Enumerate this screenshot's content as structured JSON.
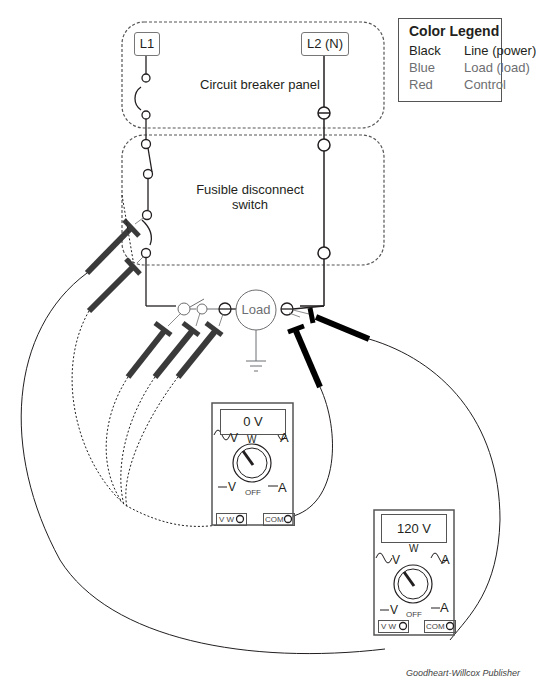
{
  "legend": {
    "title": "Color Legend",
    "rows": [
      {
        "color": "Black",
        "meaning": "Line (power)",
        "hex": "#231f20"
      },
      {
        "color": "Blue",
        "meaning": "Load (load)",
        "hex": "#6d6e71"
      },
      {
        "color": "Red",
        "meaning": "Control",
        "hex": "#6d6e71"
      }
    ]
  },
  "terminals": {
    "l1": "L1",
    "l2": "L2 (N)"
  },
  "panels": {
    "breaker": "Circuit breaker panel",
    "disconnect_line1": "Fusible disconnect",
    "disconnect_line2": "switch"
  },
  "load": {
    "label": "Load"
  },
  "meters": [
    {
      "id": "meter-1",
      "reading": "0 V",
      "dial_top": "W",
      "dial_off": "OFF",
      "ac_v": "V",
      "ac_a": "A",
      "dc_v": "V",
      "dc_a": "A",
      "jack_left": "V W",
      "jack_right": "COM"
    },
    {
      "id": "meter-2",
      "reading": "120 V",
      "dial_top": "W",
      "dial_off": "OFF",
      "ac_v": "V",
      "ac_a": "A",
      "dc_v": "V",
      "dc_a": "A",
      "jack_left": "V W",
      "jack_right": "COM"
    }
  ],
  "credit": "Goodheart-Willcox Publisher"
}
